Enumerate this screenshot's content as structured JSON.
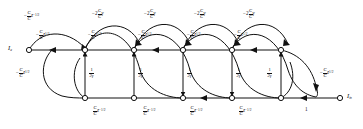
{
  "figure": {
    "type": "signal-flow-graph",
    "node_labels": {
      "input": "I",
      "input_sub": "a",
      "output": "I",
      "output_sub": "in"
    },
    "top_row_nodes": 6,
    "bottom_row_nodes": 5
  },
  "branches": {
    "top_arc_upper": [
      {
        "sign": "−",
        "num": "C",
        "num_sub": "1",
        "den": "C",
        "den_sub": "3",
        "var": "z",
        "exp": "−1/2",
        "coef": ""
      },
      {
        "sign": "−2",
        "num": "C",
        "num_sub": "16",
        "den": "C",
        "den_sub": "3",
        "var": "γ",
        "exp": "",
        "coef": "2"
      },
      {
        "sign": "−2",
        "num": "C",
        "num_sub": "15",
        "den": "C",
        "den_sub": "9",
        "var": "γ",
        "exp": "",
        "coef": "2"
      },
      {
        "sign": "−2",
        "num": "C",
        "num_sub": "17",
        "den": "C",
        "den_sub": "9",
        "var": "γ",
        "exp": "",
        "coef": "2"
      },
      {
        "sign": "−2",
        "num": "C",
        "num_sub": "18",
        "den": "C",
        "den_sub": "14",
        "var": "γ",
        "exp": "",
        "coef": "2"
      }
    ],
    "top_arc_lower": [
      {
        "sign": "−",
        "num": "C",
        "num_sub": "1",
        "den": "C",
        "den_sub": "3",
        "var": "z",
        "exp": "1/2"
      },
      {
        "sign": "−",
        "num": "C",
        "num_sub": "2",
        "den": "C",
        "den_sub": "3",
        "var": "z",
        "exp": "1/2"
      },
      {
        "sign": "−",
        "num": "C",
        "num_sub": "7",
        "den": "C",
        "den_sub": "9",
        "var": "z",
        "exp": "1/2"
      },
      {
        "sign": "−",
        "num": "C",
        "num_sub": "8",
        "den": "C",
        "den_sub": "9",
        "var": "z",
        "exp": "1/2"
      },
      {
        "sign": "−",
        "num": "C",
        "num_sub": "13",
        "den": "C",
        "den_sub": "14",
        "var": "z",
        "exp": "1/2"
      }
    ],
    "left_vertical": {
      "sign": "−",
      "num": "C",
      "num_sub": "4",
      "den": "C",
      "den_sub": "3",
      "var": "z",
      "exp": "1/2"
    },
    "right_vertical": {
      "sign": "−",
      "num": "C",
      "num_sub": "1",
      "den": "C",
      "den_sub": "14",
      "var": "z",
      "exp": "1/2"
    },
    "vertical_gains": [
      {
        "num": "1",
        "den": "2γ"
      },
      {
        "num": "1",
        "den": "2γ"
      },
      {
        "num": "1",
        "den": "2γ"
      },
      {
        "num": "1",
        "den": "2γ"
      },
      {
        "num": "1",
        "den": "2γ"
      }
    ],
    "bottom_row": [
      {
        "sign": "",
        "num": "C",
        "num_sub": "4",
        "den": "C",
        "den_sub": "6",
        "var": "z",
        "exp": "−1/2"
      },
      {
        "sign": "",
        "num": "C",
        "num_sub": "5",
        "den": "C",
        "den_sub": "6",
        "var": "z",
        "exp": "−1/2"
      },
      {
        "sign": "",
        "num": "C",
        "num_sub": "10",
        "den": "C",
        "den_sub": "12",
        "var": "z",
        "exp": "−1/2"
      },
      {
        "sign": "",
        "num": "C",
        "num_sub": "11",
        "den": "C",
        "den_sub": "12",
        "var": "z",
        "exp": "−1/2"
      }
    ],
    "bottom_right_unity": "1"
  },
  "colors": {
    "stroke": "#111111",
    "background": "#ffffff",
    "node_fill": "#ffffff"
  }
}
